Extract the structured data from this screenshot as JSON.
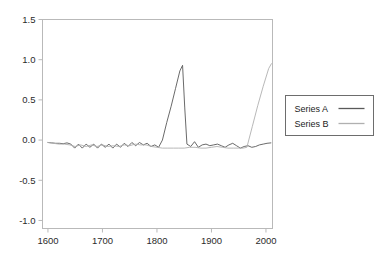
{
  "chart_data": {
    "type": "line",
    "title": "",
    "xlabel": "",
    "ylabel": "",
    "xlim": [
      1590,
      2012
    ],
    "ylim": [
      -1.1,
      1.5
    ],
    "xticks": [
      "1600",
      "1700",
      "1800",
      "1900",
      "2000"
    ],
    "xtick_values": [
      1600,
      1700,
      1800,
      1900,
      2000
    ],
    "yticks": [
      "1.5",
      "1.0",
      "0.5",
      "0.0",
      "-0.5",
      "-1.0"
    ],
    "ytick_values": [
      1.5,
      1.0,
      0.5,
      0.0,
      -0.5,
      -1.0
    ],
    "grid": false,
    "legend_position": "right",
    "series": [
      {
        "name": "Series A",
        "color": "#595959",
        "x": [
          1600,
          1607,
          1614,
          1621,
          1628,
          1635,
          1642,
          1649,
          1656,
          1663,
          1670,
          1677,
          1684,
          1691,
          1698,
          1705,
          1712,
          1719,
          1726,
          1733,
          1740,
          1747,
          1754,
          1761,
          1768,
          1775,
          1782,
          1789,
          1796,
          1803,
          1810,
          1818,
          1826,
          1834,
          1842,
          1847,
          1851,
          1855,
          1862,
          1869,
          1876,
          1883,
          1890,
          1897,
          1904,
          1911,
          1918,
          1925,
          1932,
          1939,
          1946,
          1953,
          1960,
          1967,
          1974,
          1981,
          1988,
          1995,
          2002,
          2009
        ],
        "values": [
          -0.03,
          -0.035,
          -0.04,
          -0.04,
          -0.045,
          -0.035,
          -0.05,
          -0.1,
          -0.05,
          -0.1,
          -0.05,
          -0.09,
          -0.05,
          -0.1,
          -0.05,
          -0.09,
          -0.05,
          -0.1,
          -0.05,
          -0.09,
          -0.04,
          -0.08,
          -0.03,
          -0.07,
          -0.03,
          -0.06,
          -0.04,
          -0.08,
          -0.06,
          -0.09,
          0.0,
          0.22,
          0.42,
          0.64,
          0.86,
          0.93,
          0.4,
          -0.05,
          -0.08,
          -0.02,
          -0.09,
          -0.06,
          -0.05,
          -0.07,
          -0.06,
          -0.05,
          -0.07,
          -0.09,
          -0.06,
          -0.04,
          -0.07,
          -0.1,
          -0.08,
          -0.07,
          -0.09,
          -0.08,
          -0.06,
          -0.05,
          -0.04,
          -0.035
        ]
      },
      {
        "name": "Series B",
        "color": "#b0b0b0",
        "x": [
          1600,
          1610,
          1620,
          1630,
          1640,
          1650,
          1660,
          1670,
          1680,
          1690,
          1700,
          1710,
          1720,
          1730,
          1740,
          1750,
          1760,
          1770,
          1780,
          1790,
          1800,
          1810,
          1820,
          1830,
          1840,
          1850,
          1860,
          1870,
          1880,
          1890,
          1900,
          1910,
          1920,
          1930,
          1940,
          1950,
          1958,
          1965,
          1975,
          1985,
          1995,
          2005,
          2010
        ],
        "values": [
          -0.03,
          -0.04,
          -0.05,
          -0.05,
          -0.06,
          -0.08,
          -0.06,
          -0.08,
          -0.06,
          -0.08,
          -0.06,
          -0.08,
          -0.07,
          -0.08,
          -0.06,
          -0.07,
          -0.05,
          -0.06,
          -0.06,
          -0.08,
          -0.09,
          -0.1,
          -0.1,
          -0.1,
          -0.1,
          -0.1,
          -0.09,
          -0.09,
          -0.1,
          -0.1,
          -0.09,
          -0.08,
          -0.09,
          -0.1,
          -0.1,
          -0.1,
          -0.1,
          -0.09,
          0.17,
          0.43,
          0.67,
          0.89,
          0.95
        ]
      }
    ]
  },
  "legend": {
    "entries": [
      {
        "label": "Series A"
      },
      {
        "label": "Series B"
      }
    ]
  }
}
